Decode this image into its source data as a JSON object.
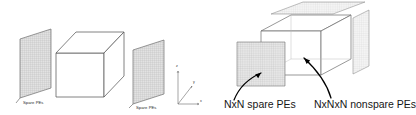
{
  "figure": {
    "background_color": "#ffffff",
    "line_color": "#4a4a4a",
    "grid_fill": "#d8d8d8",
    "arrow_color": "#000000"
  },
  "left_diagram": {
    "name": "spare-pe-planes-with-cuboid",
    "labels": {
      "spare_pes_left": "Spare PEs",
      "spare_pes_right": "Spare PEs"
    },
    "axes": {
      "z": "z",
      "y": "y",
      "x": "x"
    },
    "shapes": {
      "center_solid": "cuboid-wireframe",
      "left_plane": "grid-plane",
      "right_plane": "grid-plane"
    }
  },
  "right_diagram": {
    "name": "nxnxn-cube-with-spare-plane",
    "labels": {
      "spare": "NxN spare PEs",
      "nonspare": "NxNxN nonspare PEs"
    },
    "annotations": {
      "arrow_left": "curved-arrow-to-spare-plane",
      "arrow_right": "curved-arrow-to-nonspare-cube"
    },
    "shapes": {
      "cube": "cube-wireframe",
      "spare_plane": "grid-plane-front",
      "top_plane": "grid-plane-top",
      "side_plane": "grid-plane-side"
    }
  }
}
